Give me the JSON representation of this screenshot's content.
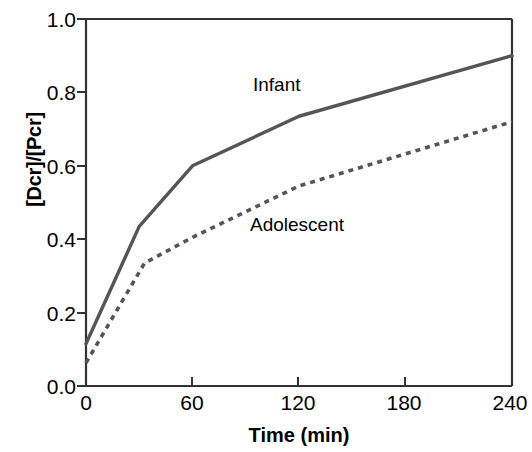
{
  "chart_data": {
    "type": "line",
    "title": "",
    "xlabel": "Time (min)",
    "ylabel": "[Dcr]/[Pcr]",
    "xlim": [
      0,
      240
    ],
    "ylim": [
      0.0,
      1.0
    ],
    "xticks": [
      0,
      60,
      120,
      180,
      240
    ],
    "xtick_labels": [
      "0",
      "60",
      "120",
      "180",
      "240"
    ],
    "yticks": [
      0.0,
      0.2,
      0.4,
      0.6,
      0.8,
      1.0
    ],
    "ytick_labels": [
      "0.0",
      "0.2",
      "0.4",
      "0.6",
      "0.8",
      "1.0"
    ],
    "grid": false,
    "legend_position": "inline-annotations",
    "series": [
      {
        "name": "Infant",
        "style": "solid",
        "color": "#555555",
        "x": [
          0,
          30,
          60,
          120,
          240
        ],
        "values": [
          0.115,
          0.435,
          0.6,
          0.735,
          0.9
        ],
        "label_text": "Infant"
      },
      {
        "name": "Adolescent",
        "style": "dashed",
        "color": "#555555",
        "x": [
          0,
          33,
          60,
          120,
          240
        ],
        "values": [
          0.063,
          0.335,
          0.405,
          0.545,
          0.72
        ],
        "label_text": "Adolescent"
      }
    ]
  },
  "axes": {
    "y_axis_title": "[Dcr]/[Pcr]",
    "x_axis_title": "Time (min)"
  },
  "annotations": {
    "infant": "Infant",
    "adolescent": "Adolescent"
  }
}
